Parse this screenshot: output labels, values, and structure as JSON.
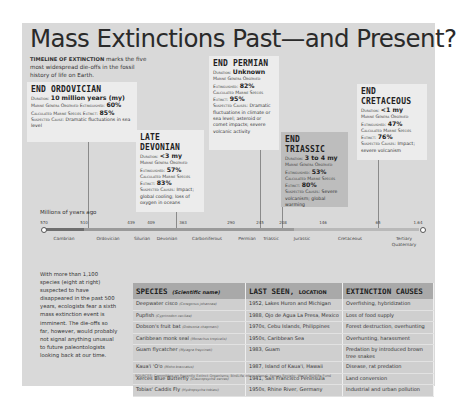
{
  "title": "Mass Extinctions Past—and Present?",
  "intro": {
    "lead": "TIMELINE OF EXTINCTION",
    "text": " marks the five most widespread die-offs in the fossil history of life on Earth."
  },
  "events": [
    {
      "name": "END ORDOVICIAN",
      "duration_label": "Duration:",
      "duration": "10 million years (my)",
      "genera_label": "Marine Genera Observed Extinguished:",
      "genera": "60%",
      "species_label": "Calculated Marine Species Extinct:",
      "species": "85%",
      "causes_label": "Suspected Cause:",
      "causes": "Dramatic fluctuations in sea level"
    },
    {
      "name": "LATE DEVONIAN",
      "duration_label": "Duration:",
      "duration": "<3 my",
      "genera_label": "Marine Genera Observed Extinguished:",
      "genera": "57%",
      "species_label": "Calculated Marine Species Extinct:",
      "species": "83%",
      "causes_label": "Suspected Causes:",
      "causes": "Impact; global cooling; loss of oxygen in oceans"
    },
    {
      "name": "END PERMIAN",
      "duration_label": "Duration:",
      "duration": "Unknown",
      "genera_label": "Marine Genera Observed Extinguished:",
      "genera": "82%",
      "species_label": "Calculated Marine Species Extinct:",
      "species": "95%",
      "causes_label": "Suspected Causes:",
      "causes": "Dramatic fluctuations in climate or sea level; asteroid or comet impacts; severe volcanic activity"
    },
    {
      "name": "END TRIASSIC",
      "duration_label": "Duration:",
      "duration": "3 to 4 my",
      "genera_label": "Marine Genera Observed Extinguished:",
      "genera": "53%",
      "species_label": "Calculated Marine Species Extinct:",
      "species": "80%",
      "causes_label": "Suspected Causes:",
      "causes": "Severe volcanism; global warming"
    },
    {
      "name": "END CRETACEOUS",
      "duration_label": "Duration:",
      "duration": "<1 my",
      "genera_label": "Marine Genera Observed Extinguished:",
      "genera": "47%",
      "species_label": "Calculated Marine Species Extinct:",
      "species": "76%",
      "causes_label": "Suspected Causes:",
      "causes": "Impact; severe volcanism"
    }
  ],
  "timeline": {
    "axis_label": "Millions of years ago",
    "ticks": [
      "570",
      "510",
      "439",
      "409",
      "363",
      "290",
      "245",
      "208",
      "146",
      "65",
      "1.64"
    ],
    "periods": [
      "Cambrian",
      "Ordovician",
      "Silurian",
      "Devonian",
      "Carboniferous",
      "Permian",
      "Triassic",
      "Jurassic",
      "Cretaceous",
      "Tertiary",
      "Quaternary"
    ]
  },
  "side_text": "With more than 1,100 species (eight at right) suspected to have disappeared in the past 500 years, ecologists fear a sixth mass extinction event is imminent. The die-offs so far, however, would probably not signal anything unusual to future paleontologists looking back at our time.",
  "table": {
    "headers": {
      "species": "SPECIES",
      "species_sub": "(Scientific name)",
      "last_seen": "LAST SEEN,",
      "last_seen_sub": "LOCATION",
      "causes": "EXTINCTION CAUSES"
    },
    "rows": [
      {
        "species": "Deepwater cisco",
        "sci": "(Coregonus johannae)",
        "last_seen": "1952, Lakes Huron and Michigan",
        "cause": "Overfishing, hybridization"
      },
      {
        "species": "Pupfish",
        "sci": "(Cyprinodon ceciliae)",
        "last_seen": "1988, Ojo de Agua La Presa, Mexico",
        "cause": "Loss of food supply"
      },
      {
        "species": "Dobson's fruit bat",
        "sci": "(Dobsonia chapmani)",
        "last_seen": "1970s, Cebu Islands, Philippines",
        "cause": "Forest destruction, overhunting"
      },
      {
        "species": "Caribbean monk seal",
        "sci": "(Monachus tropicalis)",
        "last_seen": "1950s, Caribbean Sea",
        "cause": "Overhunting, harassment"
      },
      {
        "species": "Guam flycatcher",
        "sci": "(Myiagra freycineti)",
        "last_seen": "1983, Guam",
        "cause": "Predation by introduced brown tree snakes"
      },
      {
        "species": "Kaua'i 'O'o",
        "sci": "(Moho braccatus)",
        "last_seen": "1987, Island of Kaua'i, Hawaii",
        "cause": "Disease, rat predation"
      },
      {
        "species": "Xerces Blue Butterfly",
        "sci": "(Glaucopsyche xerces)",
        "last_seen": "1941, San Francisco Peninsula",
        "cause": "Land conversion"
      },
      {
        "species": "Tobias' Caddis Fly",
        "sci": "(Hydropsyche tobiasi)",
        "last_seen": "1950s, Rhine River, Germany",
        "cause": "Industrial and urban pollution"
      }
    ]
  },
  "sources": "SOURCES: Committee on Recently Extinct Organisms; BirdLife International; Xerces Society; World Wildlife Fund",
  "colors": {
    "panel": "#d9d9d9",
    "card": "#ececec",
    "card_dark": "#bdbdbd",
    "table_header": "#a9a9a9",
    "table_cell": "#cfcfcf",
    "bar_dark": "#6e6e6e",
    "bar_light": "#a8a8a8"
  }
}
